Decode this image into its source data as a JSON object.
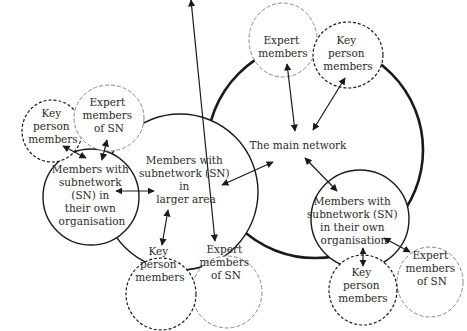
{
  "diagram": {
    "colors": {
      "stroke_dark": "#1a1a1a",
      "stroke_light": "#888888",
      "text": "#2a2a2a",
      "background": "#ffffff"
    },
    "nodes": {
      "main_network": {
        "label": [
          "The main network"
        ]
      },
      "top_expert": {
        "label": [
          "Expert",
          "members"
        ]
      },
      "top_key": {
        "label": [
          "Key",
          "person",
          "members"
        ]
      },
      "larger_area": {
        "label": [
          "Members with",
          "subnetwork (SN)",
          "in",
          "larger area"
        ]
      },
      "left_org": {
        "label": [
          "Members with",
          "subnetwork",
          "(SN) in",
          "their own",
          "organisation"
        ]
      },
      "left_key": {
        "label": [
          "Key",
          "person",
          "members"
        ]
      },
      "left_expert": {
        "label": [
          "Expert",
          "members",
          "of SN"
        ]
      },
      "bottom_key": {
        "label": [
          "Key",
          "person",
          "members"
        ]
      },
      "bottom_expert": {
        "label": [
          "Expert",
          "members",
          "of SN"
        ]
      },
      "right_org": {
        "label": [
          "Members with",
          "subnetwork (SN)",
          "in their own",
          "organisation"
        ]
      },
      "right_key": {
        "label": [
          "Key",
          "person",
          "members"
        ]
      },
      "right_expert": {
        "label": [
          "Expert",
          "members",
          "of SN"
        ]
      }
    },
    "edges": [
      {
        "from": "top_expert",
        "to": "main_network",
        "type": "bidirectional"
      },
      {
        "from": "top_key",
        "to": "main_network",
        "type": "bidirectional"
      },
      {
        "from": "larger_area",
        "to": "main_network",
        "type": "bidirectional"
      },
      {
        "from": "right_org",
        "to": "main_network",
        "type": "bidirectional"
      },
      {
        "from": "left_org",
        "to": "larger_area",
        "type": "bidirectional"
      },
      {
        "from": "left_key",
        "to": "left_org",
        "type": "bidirectional"
      },
      {
        "from": "left_expert",
        "to": "left_org",
        "type": "bidirectional"
      },
      {
        "from": "bottom_key",
        "to": "larger_area",
        "type": "bidirectional"
      },
      {
        "from": "bottom_expert",
        "to": "larger_area",
        "type": "bidirectional"
      },
      {
        "from": "right_key",
        "to": "right_org",
        "type": "bidirectional"
      },
      {
        "from": "right_expert",
        "to": "right_org",
        "type": "bidirectional"
      }
    ]
  }
}
